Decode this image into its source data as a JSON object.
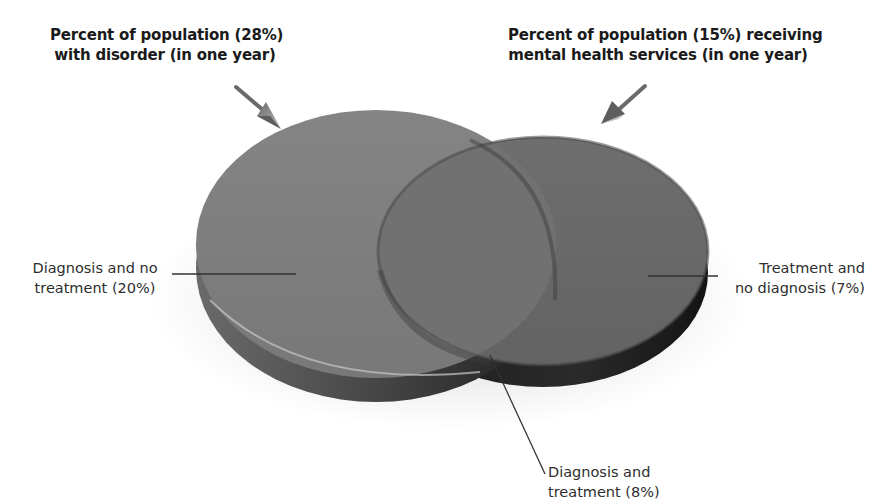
{
  "diagram": {
    "type": "venn-discs",
    "titles": {
      "left": {
        "line1": "Percent of population (28%)",
        "line2": "with disorder (in one year)"
      },
      "right": {
        "line1": "Percent of population (15%) receiving",
        "line2": "mental health services (in one year)"
      }
    },
    "labels": {
      "left": {
        "line1": "Diagnosis and no",
        "line2": "treatment (20%)"
      },
      "right": {
        "line1": "Treatment and",
        "line2": "no diagnosis (7%)"
      },
      "bottom": {
        "line1": "Diagnosis and",
        "line2": "treatment (8%)"
      }
    },
    "sets": [
      {
        "name": "With disorder",
        "percent": 28
      },
      {
        "name": "Receiving mental health services",
        "percent": 15
      }
    ],
    "regions": [
      {
        "name": "Diagnosis and no treatment",
        "percent": 20
      },
      {
        "name": "Diagnosis and treatment",
        "percent": 8
      },
      {
        "name": "Treatment and no diagnosis",
        "percent": 7
      }
    ],
    "colors": {
      "large_disc_top": "#7d7d7d",
      "small_disc_top": "#6a6a6a",
      "overlap_top": "#747474",
      "rim_dark": "#2a2a2a",
      "rim_mid": "#555555",
      "leader_line": "#333333",
      "arrow": "#8a8a8a"
    }
  }
}
